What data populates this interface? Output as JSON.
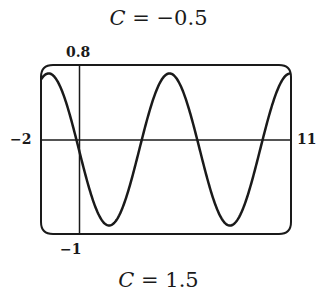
{
  "titles": {
    "top_var": "C",
    "top_rest": " = −0.5",
    "bottom_var": "C",
    "bottom_rest": " = 1.5"
  },
  "ticks": {
    "xmin": "−2",
    "xmax": "11",
    "ymax": "0.8",
    "ymin": "−1"
  },
  "colors": {
    "line": "#1a1a1a",
    "background": "#ffffff"
  },
  "chart_data": {
    "type": "line",
    "title": "C = −0.5",
    "subtitle": "C = 1.5",
    "xlabel": "",
    "ylabel": "",
    "xlim": [
      -2,
      11
    ],
    "ylim": [
      -1,
      0.8
    ],
    "grid": false,
    "legend": null,
    "series": [
      {
        "name": "curve",
        "formula": "0.81*cos(x+1.6)-0.1",
        "amplitude": 0.81,
        "phase": 1.6,
        "offset": -0.1,
        "x": [
          -2,
          -1.6,
          0,
          1.5,
          3,
          4.7,
          6,
          7.8,
          9.5,
          11
        ],
        "values": [
          0.64,
          0.71,
          -0.13,
          -0.91,
          -0.36,
          0.71,
          0.26,
          -0.91,
          -0.46,
          0.69
        ]
      }
    ],
    "annotations": [
      "peaks near x≈-1.6, 4.7, 11",
      "troughs near x≈1.5, 7.8"
    ]
  }
}
